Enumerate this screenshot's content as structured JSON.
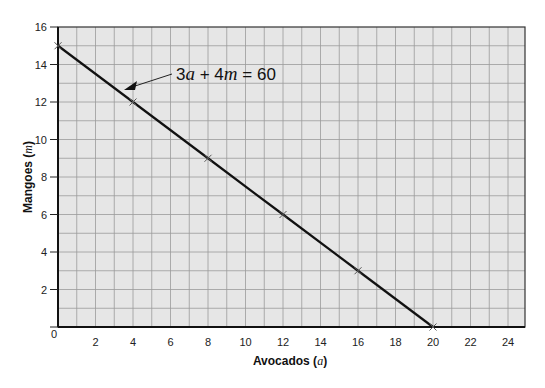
{
  "chart_data": {
    "type": "line",
    "title": "",
    "xlabel": "Avocados (a)",
    "ylabel": "Mangoes (m)",
    "xlabel_text": "Avocados",
    "xlabel_var": "a",
    "ylabel_text": "Mangoes",
    "ylabel_var": "m",
    "xlim": [
      0,
      25
    ],
    "ylim": [
      0,
      16
    ],
    "x_ticks": [
      0,
      2,
      4,
      6,
      8,
      10,
      12,
      14,
      16,
      18,
      20,
      22,
      24
    ],
    "y_ticks": [
      2,
      4,
      6,
      8,
      10,
      12,
      14,
      16
    ],
    "grid": true,
    "grid_step": 1,
    "series": [
      {
        "name": "3a + 4m = 60",
        "x": [
          0,
          4,
          8,
          12,
          16,
          20
        ],
        "y": [
          15,
          12,
          9,
          6,
          3,
          0
        ],
        "markers": "x"
      }
    ],
    "annotations": [
      {
        "text": "3a + 4m = 60",
        "arrow_to": [
          3.3,
          13.0
        ]
      }
    ]
  },
  "labels": {
    "x_origin": "0",
    "equation": {
      "coef_a": "3",
      "var_a": "a",
      "plus": " + 4",
      "var_m": "m",
      "rhs": " = 60"
    },
    "x_axis": {
      "text": "Avocados (",
      "var": "a",
      "close": ")"
    },
    "y_axis": {
      "text": "Mangoes (",
      "var": "m",
      "close": ")"
    }
  },
  "colors": {
    "plot_bg": "#e6e6e6",
    "grid": "#9a9a9a",
    "frame": "#333333",
    "line": "#111111"
  }
}
